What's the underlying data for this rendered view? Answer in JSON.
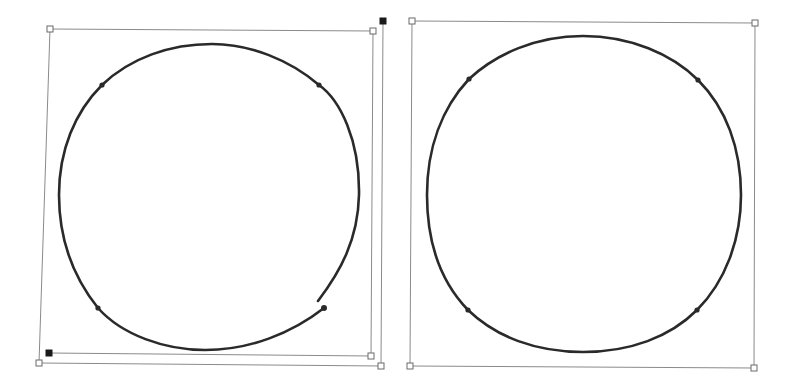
{
  "colors": {
    "background": "#ffffff",
    "path_stroke": "#2a2a2a",
    "box_stroke": "#8a8a8a",
    "handle_fill_hollow": "#ffffff",
    "handle_fill_solid": "#1a1a1a",
    "anchor_fill": "#2a2a2a"
  },
  "shapes": [
    {
      "id": "left",
      "description": "open circular path being transformed (bounding box skewed)",
      "path_closed": false,
      "bounding_box_lines": [
        [
          [
            50,
            29
          ],
          [
            373,
            31
          ]
        ],
        [
          [
            50,
            29
          ],
          [
            39,
            363
          ]
        ],
        [
          [
            39,
            363
          ],
          [
            381,
            366
          ]
        ],
        [
          [
            373,
            31
          ],
          [
            371,
            356
          ]
        ],
        [
          [
            49,
            353
          ],
          [
            371,
            356
          ]
        ],
        [
          [
            383,
            21
          ],
          [
            381,
            366
          ]
        ]
      ],
      "hollow_handles": [
        [
          50,
          29
        ],
        [
          373,
          31
        ],
        [
          371,
          356
        ],
        [
          39,
          363
        ],
        [
          381,
          366
        ]
      ],
      "solid_handles": [
        [
          383,
          21
        ],
        [
          49,
          353
        ]
      ],
      "anchors": [
        [
          102,
          85
        ],
        [
          319,
          85
        ],
        [
          98,
          308
        ],
        [
          324,
          308
        ]
      ]
    },
    {
      "id": "right",
      "description": "closed circular path with bounding box",
      "path_closed": true,
      "bounding_box_lines": [
        [
          [
            412,
            21
          ],
          [
            755,
            23
          ]
        ],
        [
          [
            755,
            23
          ],
          [
            754,
            368
          ]
        ],
        [
          [
            754,
            368
          ],
          [
            410,
            366
          ]
        ],
        [
          [
            410,
            366
          ],
          [
            412,
            21
          ]
        ]
      ],
      "hollow_handles": [
        [
          412,
          21
        ],
        [
          755,
          23
        ],
        [
          410,
          366
        ],
        [
          754,
          368
        ]
      ],
      "solid_handles": [],
      "anchors": [
        [
          469,
          79
        ],
        [
          698,
          80
        ],
        [
          468,
          310
        ],
        [
          697,
          310
        ]
      ]
    }
  ]
}
